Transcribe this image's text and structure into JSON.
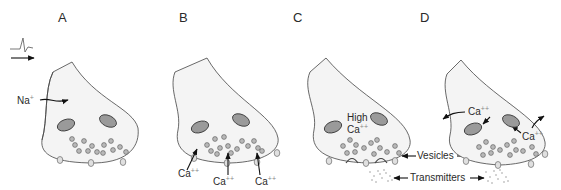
{
  "panels": [
    {
      "letter": "A",
      "labels": {
        "ion": "Na",
        "ion_charge": "+"
      }
    },
    {
      "letter": "B",
      "labels": {
        "ion": "Ca",
        "ion_charge": "++"
      }
    },
    {
      "letter": "C",
      "labels": {
        "high": "High",
        "ion": "Ca",
        "ion_charge": "++"
      }
    },
    {
      "letter": "D",
      "labels": {
        "ion": "Ca",
        "ion_charge": "++"
      }
    }
  ],
  "shared_labels": {
    "vesicles": "Vesicles",
    "transmitters": "Transmitters"
  },
  "icons": {
    "action_potential": "spike-waveform-icon",
    "direction": "arrow-right-icon"
  },
  "colors": {
    "terminal_fill": "#f4f4f4",
    "outline": "#444444",
    "mitochondria": "#9a9a9a",
    "vesicle": "#b8b8b8",
    "text": "#2a2a2a"
  }
}
